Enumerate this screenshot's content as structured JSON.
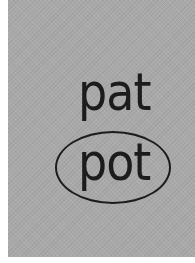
{
  "card": {
    "background_color": "#a9a9a9",
    "text_color": "#1c1c1c"
  },
  "words": [
    {
      "text": "pat",
      "circled": false
    },
    {
      "text": "pot",
      "circled": true
    }
  ]
}
